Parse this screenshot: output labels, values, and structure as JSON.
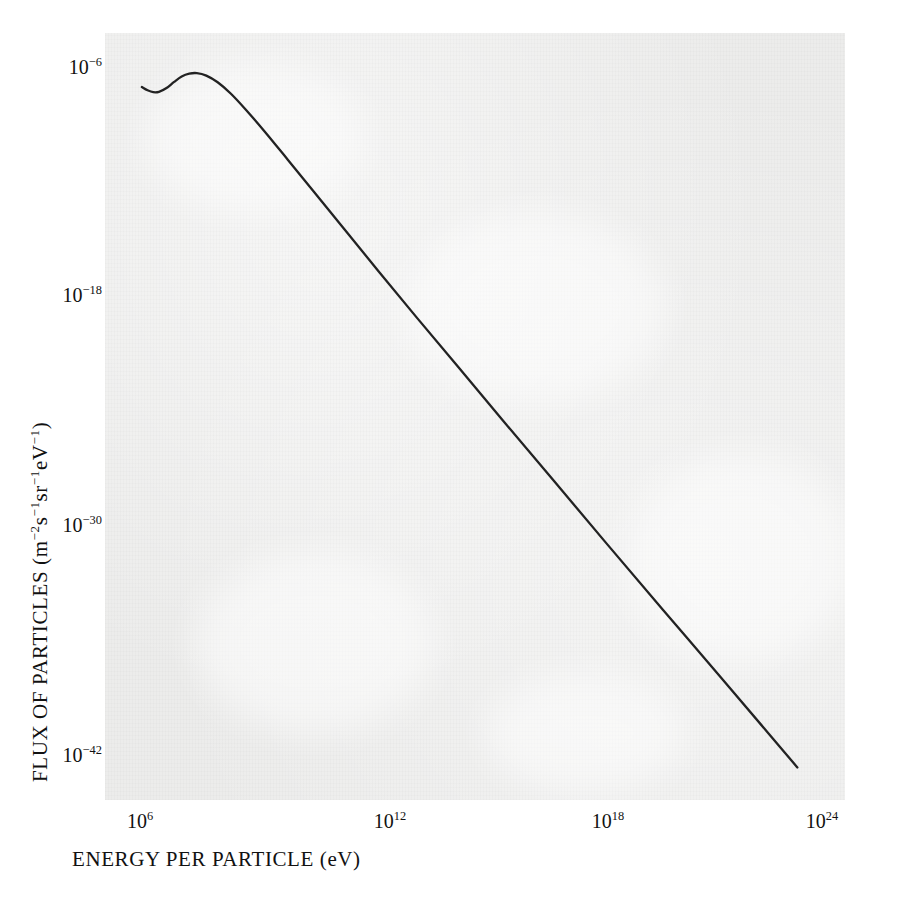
{
  "chart_data": {
    "type": "line",
    "title": "",
    "xlabel": "ENERGY PER PARTICLE (eV)",
    "ylabel": "FLUX OF PARTICLES (m⁻²s⁻¹sr⁻¹eV⁻¹)",
    "xscale": "log",
    "yscale": "log",
    "xlim": [
      1000000.0,
      1e+24
    ],
    "ylim": [
      1e-42,
      1e-06
    ],
    "grid": false,
    "legend": null,
    "xticks": [
      {
        "value": 1000000.0,
        "mantissa": "10",
        "exponent": "6"
      },
      {
        "value": 1000000000000.0,
        "mantissa": "10",
        "exponent": "12"
      },
      {
        "value": 1e+18,
        "mantissa": "10",
        "exponent": "18"
      },
      {
        "value": 1e+24,
        "mantissa": "10",
        "exponent": "24"
      }
    ],
    "yticks": [
      {
        "value": 1e-06,
        "mantissa": "10",
        "exponent": "−6"
      },
      {
        "value": 1e-18,
        "mantissa": "10",
        "exponent": "−18"
      },
      {
        "value": 1e-30,
        "mantissa": "10",
        "exponent": "−30"
      },
      {
        "value": 1e-42,
        "mantissa": "10",
        "exponent": "−42"
      }
    ],
    "series": [
      {
        "name": "cosmic ray all-particle spectrum",
        "color": "#222222",
        "linewidth": 2.3,
        "points_log10": [
          [
            6.05,
            -7.05
          ],
          [
            6.2,
            -7.22
          ],
          [
            6.35,
            -7.32
          ],
          [
            6.5,
            -7.3
          ],
          [
            6.7,
            -7.1
          ],
          [
            6.9,
            -6.78
          ],
          [
            7.1,
            -6.5
          ],
          [
            7.3,
            -6.35
          ],
          [
            7.5,
            -6.32
          ],
          [
            7.75,
            -6.45
          ],
          [
            8.05,
            -6.8
          ],
          [
            8.4,
            -7.4
          ],
          [
            8.8,
            -8.25
          ],
          [
            9.3,
            -9.4
          ],
          [
            9.9,
            -10.85
          ],
          [
            10.6,
            -12.55
          ],
          [
            11.4,
            -14.5
          ],
          [
            12.3,
            -16.7
          ],
          [
            13.3,
            -19.1
          ],
          [
            14.4,
            -21.7
          ],
          [
            15.6,
            -24.55
          ],
          [
            16.9,
            -27.6
          ],
          [
            18.3,
            -30.9
          ],
          [
            19.8,
            -34.4
          ],
          [
            21.4,
            -38.1
          ],
          [
            22.6,
            -40.9
          ],
          [
            23.35,
            -42.65
          ]
        ]
      }
    ],
    "annotations": []
  },
  "colors": {
    "plot_background": "#ececeb",
    "page_background": "#ffffff",
    "curve": "#222222",
    "text": "#111111"
  },
  "geometry": {
    "plot_left_px": 105,
    "plot_top_px": 33,
    "plot_width_px": 740,
    "plot_height_px": 767
  }
}
